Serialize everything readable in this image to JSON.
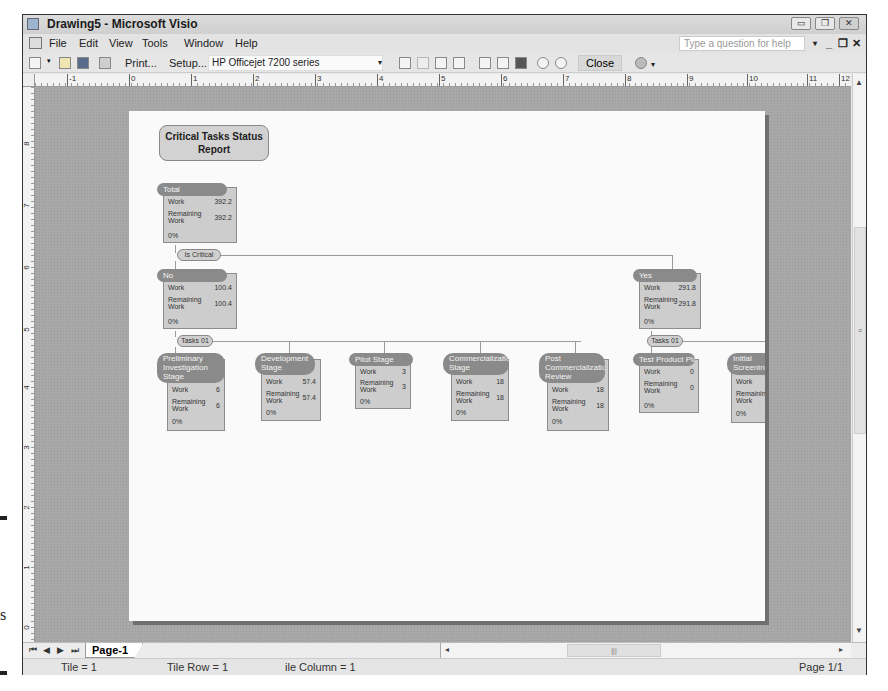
{
  "window": {
    "title": "Drawing5 - Microsoft Visio",
    "controls": [
      "minimize",
      "restore",
      "close"
    ]
  },
  "menubar": {
    "items": [
      {
        "label": "File",
        "accel": "F"
      },
      {
        "label": "Edit",
        "accel": "E"
      },
      {
        "label": "View",
        "accel": "V"
      },
      {
        "label": "Tools",
        "accel": "T"
      },
      {
        "label": "Window",
        "accel": "W"
      },
      {
        "label": "Help",
        "accel": "H"
      }
    ],
    "help_placeholder": "Type a question for help",
    "mdi_controls": [
      "▾",
      "_",
      "❐",
      "✕"
    ]
  },
  "toolbar": {
    "print_label": "Print...",
    "setup_label": "Setup...",
    "printer_value": "HP Officejet 7200 series",
    "close_label": "Close",
    "icons": [
      "new-icon",
      "open-icon",
      "save-icon",
      "printer-icon",
      "first-page-icon",
      "prev-page-icon",
      "next-page-icon",
      "last-page-icon",
      "single-tile-icon",
      "whole-page-icon",
      "current-view-icon",
      "zoom-out-icon",
      "zoom-in-icon",
      "help-icon"
    ]
  },
  "ruler": {
    "horizontal": [
      "-1",
      "0",
      "1",
      "2",
      "3",
      "4",
      "5",
      "6",
      "7",
      "8",
      "9",
      "10",
      "11",
      "12"
    ],
    "vertical": [
      "8",
      "7",
      "6",
      "5",
      "4",
      "3",
      "2",
      "1",
      "0"
    ]
  },
  "diagram": {
    "title_line1": "Critical Tasks Status",
    "title_line2": "Report",
    "labels": {
      "work": "Work",
      "remaining1": "Remaining",
      "remaining2": "Work"
    },
    "root": {
      "name": "Total",
      "work": "392.2",
      "remaining": "392.2",
      "pct": "0%"
    },
    "group_pill": "Is Critical",
    "groups": [
      {
        "name": "No",
        "work": "100.4",
        "remaining": "100.4",
        "pct": "0%",
        "pill": "Tasks 01"
      },
      {
        "name": "Yes",
        "work": "291.8",
        "remaining": "291.8",
        "pct": "0%",
        "pill": "Tasks 01"
      }
    ],
    "tasks": [
      {
        "name": "Preliminary Investigation Stage",
        "work": "6",
        "remaining": "6",
        "pct": "0%"
      },
      {
        "name": "Development Stage",
        "work": "57.4",
        "remaining": "57.4",
        "pct": "0%"
      },
      {
        "name": "Pilot Stage",
        "work": "3",
        "remaining": "3",
        "pct": "0%"
      },
      {
        "name": "Commercialization Stage",
        "work": "18",
        "remaining": "18",
        "pct": "0%"
      },
      {
        "name": "Post Commercialization Review",
        "work": "18",
        "remaining": "18",
        "pct": "0%"
      },
      {
        "name": "Test Product Plan",
        "work": "0",
        "remaining": "0",
        "pct": "0%"
      },
      {
        "name": "Initial Screening",
        "work": "",
        "remaining": "",
        "pct": "0%"
      }
    ]
  },
  "tabs": {
    "nav": [
      "⏮",
      "◀",
      "▶",
      "⏭"
    ],
    "pages": [
      "Page-1"
    ]
  },
  "statusbar": {
    "tile": "Tile = 1",
    "tile_row": "Tile Row = 1",
    "tile_column": "ile Column = 1",
    "page": "Page 1/1"
  },
  "left_margin": {
    "letter": "s"
  }
}
